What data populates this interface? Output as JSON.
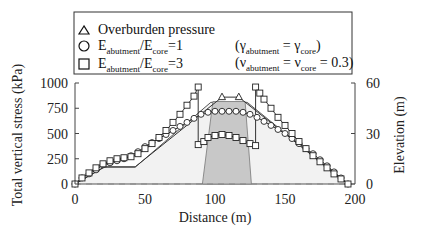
{
  "chart_data": {
    "type": "line",
    "title": "",
    "xlabel": "Distance (m)",
    "ylabel": "Total vertical stress (kPa)",
    "y2label": "Elevation (m)",
    "xlim": [
      0,
      200
    ],
    "ylim": [
      0,
      1000
    ],
    "y2lim": [
      0,
      60
    ],
    "xticks": [
      0,
      50,
      100,
      150,
      200
    ],
    "yticks": [
      0,
      250,
      500,
      750,
      1000
    ],
    "y2ticks": [
      0,
      30,
      60
    ],
    "grid": false,
    "legend_position": "top",
    "legend": {
      "overburden": "Overburden pressure",
      "e1_prefix": "E",
      "e1_sub1": "abutment",
      "e1_mid": "/E",
      "e1_sub2": "core",
      "e1_suffix": "=1",
      "e3_prefix": "E",
      "e3_sub1": "abutment",
      "e3_mid": "/E",
      "e3_sub2": "core",
      "e3_suffix": "=3",
      "note1_open": "(γ",
      "note1_sub1": "abutment",
      "note1_mid": " = γ",
      "note1_sub2": "core",
      "note1_close": ")",
      "note2_open": "(ν",
      "note2_sub1": "abutment",
      "note2_mid": " = ν",
      "note2_sub2": "core",
      "note2_close": " = 0.3)"
    },
    "embankment_profile_elevation_m": {
      "x": [
        0,
        21,
        43,
        97,
        123,
        195
      ],
      "y": [
        0,
        10,
        10,
        48.5,
        48.5,
        0
      ]
    },
    "core_zone_elevation_m": {
      "x": [
        91,
        98.5,
        121.5,
        126
      ],
      "y": [
        0,
        49,
        49,
        0
      ]
    },
    "series": [
      {
        "name": "Overburden pressure",
        "marker": "triangle",
        "x": [
          0,
          21,
          43,
          105,
          117,
          195
        ],
        "values": [
          0,
          170,
          170,
          860,
          860,
          0
        ],
        "marker_points": {
          "x": [
            105,
            117
          ],
          "values": [
            860,
            860
          ]
        }
      },
      {
        "name": "E_abutment/E_core=1",
        "marker": "circle",
        "x": [
          0,
          5,
          10,
          15,
          20,
          25,
          30,
          35,
          40,
          45,
          50,
          55,
          60,
          65,
          70,
          75,
          80,
          85,
          90,
          95,
          100,
          105,
          110,
          115,
          120,
          125,
          130,
          135,
          140,
          145,
          150,
          155,
          160,
          165,
          170,
          175,
          180,
          185,
          190,
          195
        ],
        "values": [
          0,
          60,
          100,
          140,
          190,
          210,
          230,
          250,
          280,
          320,
          370,
          410,
          450,
          490,
          530,
          570,
          610,
          650,
          690,
          710,
          720,
          720,
          720,
          720,
          710,
          690,
          660,
          620,
          580,
          540,
          500,
          450,
          400,
          350,
          300,
          240,
          180,
          120,
          60,
          0
        ]
      },
      {
        "name": "E_abutment/E_core=3",
        "marker": "square",
        "x": [
          0,
          5,
          10,
          15,
          20,
          25,
          30,
          35,
          40,
          45,
          50,
          55,
          60,
          65,
          70,
          75,
          80,
          85,
          88,
          88,
          92,
          95,
          100,
          105,
          110,
          115,
          120,
          125,
          129,
          129,
          132,
          135,
          140,
          145,
          150,
          155,
          160,
          165,
          170,
          175,
          180,
          185,
          190,
          195
        ],
        "values": [
          0,
          60,
          110,
          160,
          200,
          230,
          250,
          260,
          270,
          300,
          350,
          400,
          460,
          530,
          610,
          690,
          780,
          870,
          960,
          390,
          420,
          460,
          480,
          490,
          480,
          460,
          430,
          400,
          380,
          960,
          900,
          840,
          750,
          660,
          580,
          500,
          420,
          350,
          280,
          220,
          160,
          100,
          50,
          0
        ]
      }
    ]
  }
}
